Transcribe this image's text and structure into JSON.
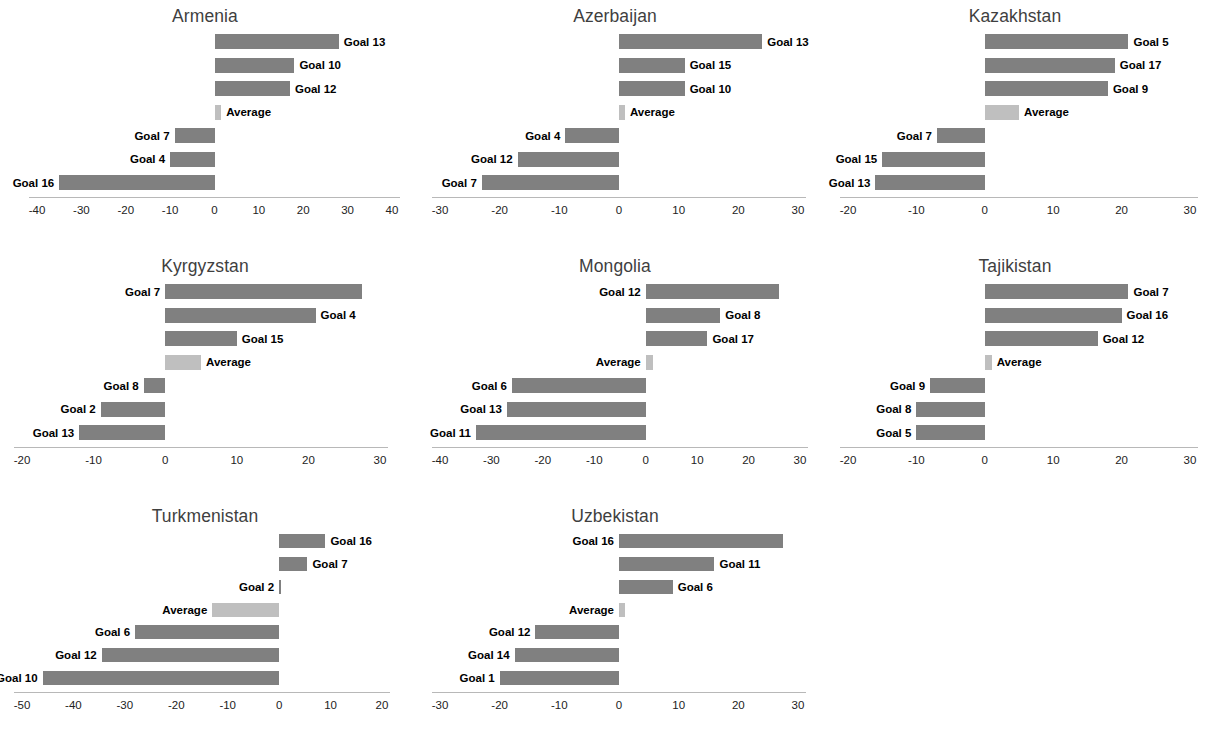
{
  "figure": {
    "panel_count": 8,
    "bar_color": "#808080",
    "average_bar_color": "#bfbfbf",
    "axis_color": "#b8b8b8",
    "title_color": "#3f3f3f"
  },
  "chart_data": [
    {
      "type": "bar",
      "orientation": "horizontal",
      "title": "Armenia",
      "xlabel": "",
      "ylabel": "",
      "xlim": [
        -40,
        40
      ],
      "xticks": [
        -40,
        -30,
        -20,
        -10,
        0,
        10,
        20,
        30,
        40
      ],
      "xticklabels": [
        "-40",
        "-30",
        "-20",
        "-10",
        "0",
        "10",
        "20",
        "30",
        "40"
      ],
      "grid": false,
      "legend": "none",
      "categories": [
        "Goal 13",
        "Goal 10",
        "Goal 12",
        "Average",
        "Goal 7",
        "Goal 4",
        "Goal 16"
      ],
      "values": [
        28,
        18,
        17,
        1.5,
        -9,
        -10,
        -35
      ]
    },
    {
      "type": "bar",
      "orientation": "horizontal",
      "title": "Azerbaijan",
      "xlabel": "",
      "ylabel": "",
      "xlim": [
        -30,
        30
      ],
      "xticks": [
        -30,
        -20,
        -10,
        0,
        10,
        20,
        30
      ],
      "xticklabels": [
        "-30",
        "-20",
        "-10",
        "0",
        "10",
        "20",
        "30"
      ],
      "grid": false,
      "legend": "none",
      "categories": [
        "Goal 13",
        "Goal 15",
        "Goal 10",
        "Average",
        "Goal 4",
        "Goal 12",
        "Goal 7"
      ],
      "values": [
        24,
        11,
        11,
        1,
        -9,
        -17,
        -23
      ]
    },
    {
      "type": "bar",
      "orientation": "horizontal",
      "title": "Kazakhstan",
      "xlabel": "",
      "ylabel": "",
      "xlim": [
        -20,
        30
      ],
      "xticks": [
        -20,
        -10,
        0,
        10,
        20,
        30
      ],
      "xticklabels": [
        "-20",
        "-10",
        "0",
        "10",
        "20",
        "30"
      ],
      "grid": false,
      "legend": "none",
      "categories": [
        "Goal 5",
        "Goal 17",
        "Goal 9",
        "Average",
        "Goal 7",
        "Goal 15",
        "Goal 13"
      ],
      "values": [
        21,
        19,
        18,
        5,
        -7,
        -15,
        -16
      ]
    },
    {
      "type": "bar",
      "orientation": "horizontal",
      "title": "Kyrgyzstan",
      "xlabel": "",
      "ylabel": "",
      "xlim": [
        -20,
        30
      ],
      "xticks": [
        -20,
        -10,
        0,
        10,
        20,
        30
      ],
      "xticklabels": [
        "-20",
        "-10",
        "0",
        "10",
        "20",
        "30"
      ],
      "grid": false,
      "legend": "none",
      "categories": [
        "Goal 7",
        "Goal 4",
        "Goal 15",
        "Average",
        "Goal 8",
        "Goal 2",
        "Goal 13"
      ],
      "values": [
        27.5,
        21,
        10,
        5,
        -3,
        -9,
        -12
      ]
    },
    {
      "type": "bar",
      "orientation": "horizontal",
      "title": "Mongolia",
      "xlabel": "",
      "ylabel": "",
      "xlim": [
        -40,
        30
      ],
      "xticks": [
        -40,
        -30,
        -20,
        -10,
        0,
        10,
        20,
        30
      ],
      "xticklabels": [
        "-40",
        "-30",
        "-20",
        "-10",
        "0",
        "10",
        "20",
        "30"
      ],
      "grid": false,
      "legend": "none",
      "categories": [
        "Goal 12",
        "Goal 8",
        "Goal 17",
        "Average",
        "Goal 6",
        "Goal 13",
        "Goal 11"
      ],
      "values": [
        26,
        14.5,
        12,
        1.5,
        -26,
        -27,
        -33
      ]
    },
    {
      "type": "bar",
      "orientation": "horizontal",
      "title": "Tajikistan",
      "xlabel": "",
      "ylabel": "",
      "xlim": [
        -20,
        30
      ],
      "xticks": [
        -20,
        -10,
        0,
        10,
        20,
        30
      ],
      "xticklabels": [
        "-20",
        "-10",
        "0",
        "10",
        "20",
        "30"
      ],
      "grid": false,
      "legend": "none",
      "categories": [
        "Goal 7",
        "Goal 16",
        "Goal 12",
        "Average",
        "Goal 9",
        "Goal 8",
        "Goal 5"
      ],
      "values": [
        21,
        20,
        16.5,
        1,
        -8,
        -10,
        -10
      ]
    },
    {
      "type": "bar",
      "orientation": "horizontal",
      "title": "Turkmenistan",
      "xlabel": "",
      "ylabel": "",
      "xlim": [
        -50,
        20
      ],
      "xticks": [
        -50,
        -40,
        -30,
        -20,
        -10,
        0,
        10,
        20
      ],
      "xticklabels": [
        "-50",
        "-40",
        "-30",
        "-20",
        "-10",
        "0",
        "10",
        "20"
      ],
      "grid": false,
      "legend": "none",
      "categories": [
        "Goal 16",
        "Goal 7",
        "Goal 2",
        "Average",
        "Goal 6",
        "Goal 12",
        "Goal 10"
      ],
      "values": [
        9,
        5.5,
        0.3,
        -13,
        -28,
        -34.5,
        -46
      ]
    },
    {
      "type": "bar",
      "orientation": "horizontal",
      "title": "Uzbekistan",
      "xlabel": "",
      "ylabel": "",
      "xlim": [
        -30,
        30
      ],
      "xticks": [
        -30,
        -20,
        -10,
        0,
        10,
        20,
        30
      ],
      "xticklabels": [
        "-30",
        "-20",
        "-10",
        "0",
        "10",
        "20",
        "30"
      ],
      "grid": false,
      "legend": "none",
      "categories": [
        "Goal 16",
        "Goal 11",
        "Goal 6",
        "Average",
        "Goal 12",
        "Goal 14",
        "Goal 1"
      ],
      "values": [
        27.5,
        16,
        9,
        1,
        -14,
        -17.5,
        -20
      ]
    }
  ]
}
